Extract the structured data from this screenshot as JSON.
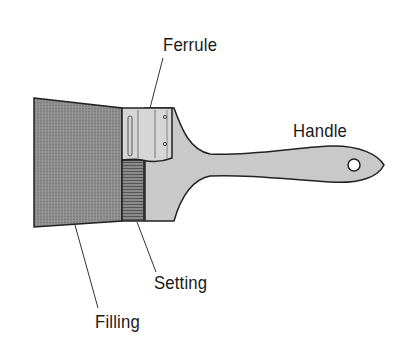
{
  "diagram": {
    "labels": {
      "ferrule": "Ferrule",
      "handle": "Handle",
      "setting": "Setting",
      "filling": "Filling"
    },
    "colors": {
      "filling": "#8a8a8a",
      "ferrule": "#d4d4d4",
      "handle": "#c8c8c8",
      "setting": "#7a7a7a",
      "outline": "#222222",
      "text": "#1a1a1a"
    }
  }
}
